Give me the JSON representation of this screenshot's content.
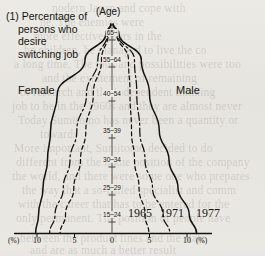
{
  "figure": {
    "title_lines": [
      "(1) Percentage of",
      "persons who",
      "desire",
      "switching job"
    ],
    "age_axis_caption": "(Age)",
    "left_side_label": "Female",
    "right_side_label": "Male",
    "left_unit": "(%)",
    "right_unit": "(%)"
  },
  "series_labels": [
    {
      "label": "1965"
    },
    {
      "label": "1971"
    },
    {
      "label": "1977"
    }
  ],
  "chart_data": {
    "type": "line",
    "title": "(1) Percentage of persons who desire switching job",
    "subtitle": "",
    "xlabel": "(%)",
    "ylabel": "(Age)",
    "orientation": "horizontal-butterfly",
    "grid": false,
    "legend_position": "bottom-right-inline",
    "xlim": [
      -10,
      10
    ],
    "x_ticks": [
      "10",
      "5",
      "0",
      "5",
      "10"
    ],
    "x_tick_values": [
      -10,
      -5,
      0,
      5,
      10
    ],
    "categories": [
      "15~24",
      "25~29",
      "30~34",
      "35~39",
      "40~54",
      "55~64",
      "65~"
    ],
    "category_labels": [
      "15~24",
      "25~29",
      "30~34",
      "35~39",
      "40~54",
      "55~64",
      "65~"
    ],
    "groups": [
      {
        "name": "Female",
        "side": "left",
        "series": [
          {
            "name": "1965",
            "style": "dashed",
            "values": [
              6.2,
              5.1,
              4.2,
              3.5,
              2.5,
              1.4,
              0.5
            ]
          },
          {
            "name": "1971",
            "style": "dash-dot",
            "values": [
              7.6,
              6.5,
              5.6,
              4.7,
              3.4,
              1.9,
              0.6
            ]
          },
          {
            "name": "1977",
            "style": "solid",
            "values": [
              9.8,
              9.2,
              8.6,
              8.2,
              7.3,
              3.6,
              0.8
            ]
          }
        ]
      },
      {
        "name": "Male",
        "side": "right",
        "series": [
          {
            "name": "1965",
            "style": "dashed",
            "values": [
              4.4,
              3.6,
              3.0,
              2.6,
              2.4,
              2.2,
              0.6
            ]
          },
          {
            "name": "1971",
            "style": "dash-dot",
            "values": [
              6.8,
              5.4,
              4.4,
              3.7,
              3.3,
              3.0,
              0.7
            ]
          },
          {
            "name": "1977",
            "style": "solid",
            "values": [
              10.3,
              8.8,
              7.6,
              6.3,
              5.0,
              3.9,
              0.9
            ]
          }
        ]
      }
    ]
  },
  "ghost_text": [
    {
      "t": "nodern Japan and cope with",
      "x": 52,
      "y": 2
    },
    {
      "t": "ne. The enemies were",
      "x": 40,
      "y": 16
    },
    {
      "t": "more effective years in the",
      "x": 34,
      "y": 30
    },
    {
      "t": "he children, he managed to live the co",
      "x": 24,
      "y": 44
    },
    {
      "t": "a long time. The jobs and possibilities were too",
      "x": 14,
      "y": 58
    },
    {
      "t": "and the excitement of remaining",
      "x": 42,
      "y": 72
    },
    {
      "t": "of research and the independent thinking",
      "x": 20,
      "y": 86
    },
    {
      "t": "job to be in the 1960s and they are almost never",
      "x": 12,
      "y": 100
    },
    {
      "t": "Today Sumitomo has never been a quantity or",
      "x": 18,
      "y": 114
    },
    {
      "t": "towards",
      "x": 40,
      "y": 128
    },
    {
      "t": "More important, Sumitomo decided to do",
      "x": 14,
      "y": 142
    },
    {
      "t": "different from the home position of the company",
      "x": 16,
      "y": 156
    },
    {
      "t": "the world, and there were some one who prepares",
      "x": 12,
      "y": 170
    },
    {
      "t": "the way that a so-called specialist and comm",
      "x": 22,
      "y": 184
    },
    {
      "t": "with the career that has to be entered for the",
      "x": 18,
      "y": 198
    },
    {
      "t": "only permanent. The position of people have",
      "x": 16,
      "y": 212
    },
    {
      "t": "between the product lines and the state",
      "x": 20,
      "y": 232
    },
    {
      "t": "and are as much a better result",
      "x": 30,
      "y": 244
    }
  ]
}
